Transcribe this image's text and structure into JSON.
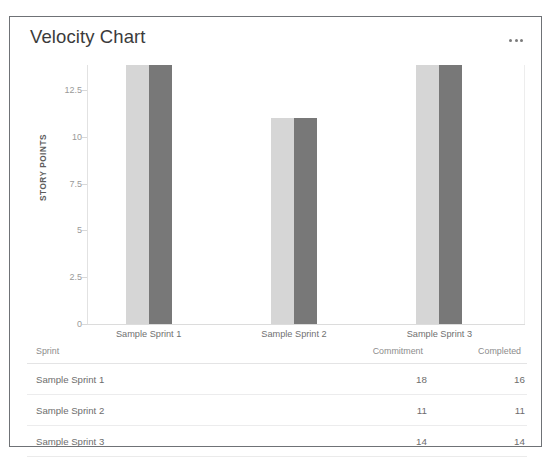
{
  "card": {
    "title": "Velocity Chart",
    "menu_icon": "ellipsis-horizontal-icon"
  },
  "chart_data": {
    "type": "bar",
    "title": "Velocity Chart",
    "xlabel": "",
    "ylabel": "STORY POINTS",
    "categories": [
      "Sample Sprint 1",
      "Sample Sprint 2",
      "Sample Sprint 3"
    ],
    "series": [
      {
        "name": "Commitment",
        "values": [
          18,
          11,
          14
        ],
        "color": "#d6d6d6"
      },
      {
        "name": "Completed",
        "values": [
          16,
          11,
          14
        ],
        "color": "#787878"
      }
    ],
    "yticks": [
      "0",
      "2.5",
      "5",
      "7.5",
      "10",
      "12.5"
    ],
    "ytick_values": [
      0,
      2.5,
      5,
      7.5,
      10,
      12.5
    ],
    "ylim": [
      0,
      13.85
    ],
    "grid": false,
    "legend": "none",
    "note": "bars are clipped at the top of the plot area"
  },
  "table": {
    "headers": [
      "Sprint",
      "Commitment",
      "Completed"
    ],
    "rows": [
      {
        "sprint": "Sample Sprint 1",
        "commitment": "18",
        "completed": "16"
      },
      {
        "sprint": "Sample Sprint 2",
        "commitment": "11",
        "completed": "11"
      },
      {
        "sprint": "Sample Sprint 3",
        "commitment": "14",
        "completed": "14"
      }
    ]
  }
}
